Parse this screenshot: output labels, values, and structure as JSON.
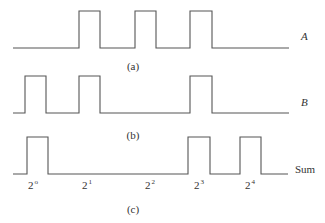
{
  "figure": {
    "type": "timing-diagram",
    "stroke_color": "#555555",
    "text_color": "#333333",
    "waveforms": [
      {
        "id": "A",
        "label": "A",
        "caption": "(a)",
        "baseline_y": 48,
        "high_y": 11,
        "x_start": 13,
        "x_end": 289,
        "pulses": [
          [
            79,
            100
          ],
          [
            135,
            156
          ],
          [
            190,
            212
          ]
        ],
        "label_pos": [
          301,
          31
        ],
        "caption_pos": [
          133,
          61
        ]
      },
      {
        "id": "B",
        "label": "B",
        "caption": "(b)",
        "baseline_y": 113,
        "high_y": 76,
        "x_start": 13,
        "x_end": 289,
        "pulses": [
          [
            25,
            46
          ],
          [
            79,
            100
          ],
          [
            190,
            212
          ]
        ],
        "label_pos": [
          301,
          97
        ],
        "caption_pos": [
          133,
          130
        ]
      },
      {
        "id": "Sum",
        "label": "Sum",
        "caption": "(c)",
        "baseline_y": 174,
        "high_y": 137,
        "x_start": 13,
        "x_end": 288,
        "pulses": [
          [
            27,
            48
          ],
          [
            188,
            210
          ],
          [
            240,
            261
          ]
        ],
        "label_pos": [
          295,
          164
        ],
        "caption_pos": [
          133,
          204
        ]
      }
    ],
    "powers": [
      {
        "base": "2",
        "exp": "o",
        "x": 33
      },
      {
        "base": "2",
        "exp": "1",
        "x": 87
      },
      {
        "base": "2",
        "exp": "2",
        "x": 150
      },
      {
        "base": "2",
        "exp": "3",
        "x": 199
      },
      {
        "base": "2",
        "exp": "4",
        "x": 250
      }
    ],
    "powers_y": 179
  },
  "labels": {
    "a": "A",
    "b": "B",
    "sum": "Sum",
    "cap_a": "(a)",
    "cap_b": "(b)",
    "cap_c": "(c)"
  }
}
